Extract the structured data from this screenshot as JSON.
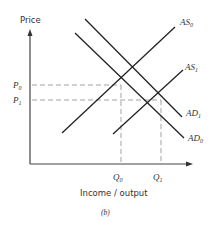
{
  "diagram": {
    "y_axis_label": "Price",
    "x_axis_label": "Income / output",
    "caption": "(b)",
    "price_levels": [
      {
        "main": "P",
        "sub": "0"
      },
      {
        "main": "P",
        "sub": "1"
      }
    ],
    "quantity_levels": [
      {
        "main": "Q",
        "sub": "0"
      },
      {
        "main": "Q",
        "sub": "1"
      }
    ],
    "curves": [
      {
        "main": "AS",
        "sub": "0"
      },
      {
        "main": "AS",
        "sub": "1"
      },
      {
        "main": "AD",
        "sub": "1"
      },
      {
        "main": "AD",
        "sub": "0"
      }
    ],
    "colors": {
      "line": "#222222",
      "dashed": "#999999",
      "axis": "#444444"
    }
  }
}
